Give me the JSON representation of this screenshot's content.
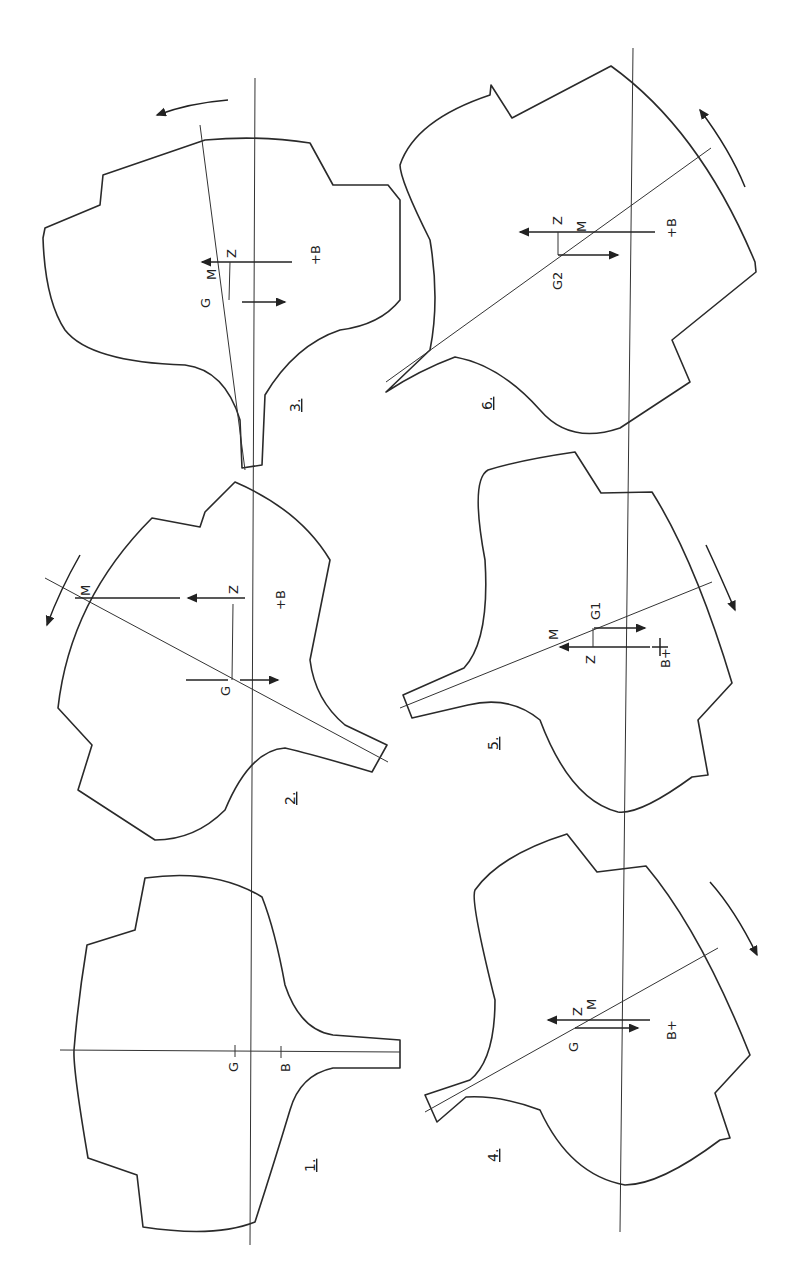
{
  "figure": {
    "stroke_color": "#2a2a2a",
    "background": "#ffffff"
  },
  "sections": [
    {
      "id": "1",
      "label": "1.",
      "points": {
        "G": "G",
        "B": "B"
      }
    },
    {
      "id": "2",
      "label": "2.",
      "points": {
        "G": "G",
        "M": "M",
        "Z": "Z",
        "B": "+B"
      }
    },
    {
      "id": "3",
      "label": "3.",
      "points": {
        "G": "G",
        "M": "M",
        "Z": "Z",
        "B": "+B"
      }
    },
    {
      "id": "4",
      "label": "4.",
      "points": {
        "G": "G",
        "M": "M",
        "Z": "Z",
        "B": "B+"
      }
    },
    {
      "id": "5",
      "label": "5.",
      "points": {
        "G": "G1",
        "M": "M",
        "Z": "Z",
        "B": "B+"
      }
    },
    {
      "id": "6",
      "label": "6.",
      "points": {
        "G": "G2",
        "M": "M",
        "Z": "Z",
        "B": "+B"
      }
    }
  ]
}
